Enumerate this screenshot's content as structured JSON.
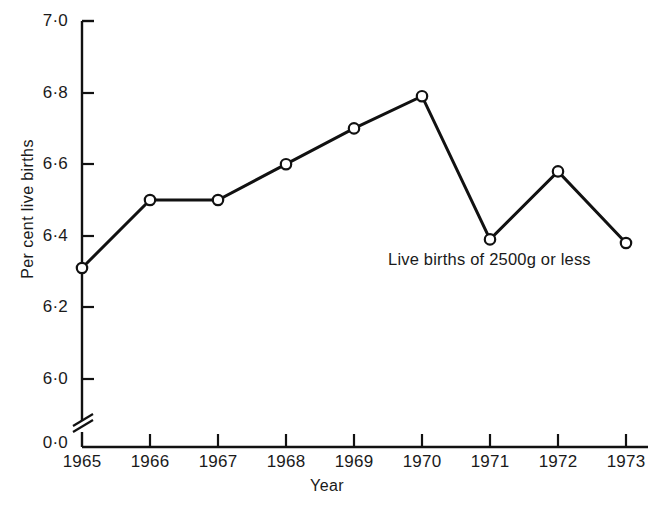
{
  "chart_data": {
    "type": "line",
    "title": "",
    "subtitle": "",
    "xlabel": "Year",
    "ylabel": "Per cent live births",
    "categories": [
      "1965",
      "1966",
      "1967",
      "1968",
      "1969",
      "1970",
      "1971",
      "1972",
      "1973"
    ],
    "x": [
      1965,
      1966,
      1967,
      1968,
      1969,
      1970,
      1971,
      1972,
      1973
    ],
    "series": [
      {
        "name": "Live births of 2500g or less",
        "values": [
          6.31,
          6.5,
          6.5,
          6.6,
          6.7,
          6.79,
          6.39,
          6.58,
          6.38
        ],
        "marker": "open-circle",
        "line_color": "#111111"
      }
    ],
    "ylim": [
      6.0,
      7.0
    ],
    "y_tick_labels": [
      "7·0",
      "6·8",
      "6·6",
      "6·4",
      "6·2",
      "6·0",
      "0·0"
    ],
    "y_tick_values": [
      7.0,
      6.8,
      6.6,
      6.4,
      6.2,
      6.0,
      0.0
    ],
    "axis_break": true,
    "axis_break_note": "y-axis broken between 6·0 and 0·0",
    "grid": false,
    "legend_position": "none",
    "annotations": [
      {
        "text": "Live births of  2500g or less",
        "x": 1970,
        "y": 6.34
      }
    ]
  },
  "axis": {
    "y_label": "Per cent live births",
    "x_label": "Year",
    "ticks_y": [
      {
        "label": "7·0",
        "px": 21
      },
      {
        "label": "6·8",
        "px": 93
      },
      {
        "label": "6·6",
        "px": 164
      },
      {
        "label": "6·4",
        "px": 236
      },
      {
        "label": "6·2",
        "px": 307
      },
      {
        "label": "6·0",
        "px": 379
      },
      {
        "label": "0·0",
        "px": 443
      }
    ],
    "ticks_x": [
      {
        "label": "1965",
        "px": 82
      },
      {
        "label": "1966",
        "px": 150
      },
      {
        "label": "1967",
        "px": 218
      },
      {
        "label": "1968",
        "px": 286
      },
      {
        "label": "1969",
        "px": 354
      },
      {
        "label": "1970",
        "px": 422
      },
      {
        "label": "1971",
        "px": 490
      },
      {
        "label": "1972",
        "px": 558
      },
      {
        "label": "1973",
        "px": 626
      }
    ]
  },
  "annotation": {
    "text": "Live births of  2500g or less"
  },
  "style": {
    "ink": "#111111",
    "paper": "#ffffff",
    "marker_fill": "#ffffff"
  }
}
